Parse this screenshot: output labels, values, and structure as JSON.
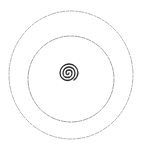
{
  "image": {
    "description": "Hand-drawn pencil sketch of two concentric circles with a small spiral at the center",
    "background": "#ffffff",
    "stroke_light": "#9a9a9a",
    "stroke_dark": "#2a2a2a",
    "shapes": [
      {
        "type": "circle",
        "name": "outer-circle",
        "cx": 71,
        "cy": 75,
        "rx": 62,
        "ry": 64
      },
      {
        "type": "circle",
        "name": "inner-circle",
        "cx": 71,
        "cy": 79,
        "rx": 43,
        "ry": 43
      },
      {
        "type": "spiral",
        "name": "center-spiral",
        "cx": 68,
        "cy": 73,
        "r": 11,
        "turns": 3
      }
    ]
  }
}
